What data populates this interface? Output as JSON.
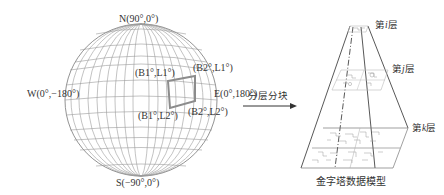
{
  "globe": {
    "north": "N(90°,0°)",
    "south": "S(−90°,0°)",
    "west": "W(0°,−180°)",
    "east": "E(0°,180°)",
    "tile_corners": {
      "top_left": "(B1°,L1°)",
      "top_right": "(B2°,L1°)",
      "bottom_left": "(B1°,L2°)",
      "bottom_right": "(B2°,L2°)"
    },
    "colors": {
      "grid": "#9a9a9a",
      "tile": "#8c8c8c"
    }
  },
  "arrow": {
    "label": "分层分块"
  },
  "pyramid": {
    "levels": [
      {
        "label_prefix": "第",
        "var": "i",
        "label_suffix": "层"
      },
      {
        "label_prefix": "第",
        "var": "j",
        "label_suffix": "层"
      },
      {
        "label_prefix": "第",
        "var": "k",
        "label_suffix": "层"
      }
    ],
    "caption": "金字塔数据模型"
  }
}
